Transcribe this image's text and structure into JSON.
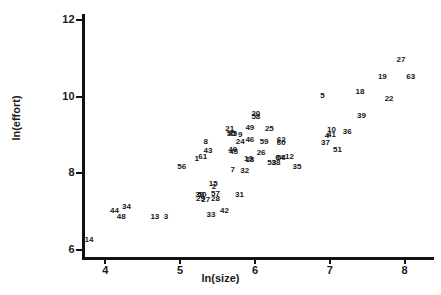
{
  "chart_data": {
    "type": "scatter",
    "title": "",
    "xlabel": "ln(size)",
    "ylabel": "ln(effort)",
    "xlim": [
      3.7,
      8.35
    ],
    "ylim": [
      5.8,
      12.15
    ],
    "xticks": [
      4,
      5,
      6,
      7,
      8
    ],
    "yticks": [
      6,
      8,
      10,
      12
    ],
    "grid": false,
    "legend": null,
    "point_label_field": "case number",
    "points": [
      {
        "label": "14",
        "x": 3.78,
        "y": 6.27
      },
      {
        "label": "44",
        "x": 4.12,
        "y": 7.02
      },
      {
        "label": "34",
        "x": 4.28,
        "y": 7.12
      },
      {
        "label": "48",
        "x": 4.21,
        "y": 6.87
      },
      {
        "label": "13",
        "x": 4.66,
        "y": 6.88
      },
      {
        "label": "3",
        "x": 4.81,
        "y": 6.86
      },
      {
        "label": "56",
        "x": 5.02,
        "y": 8.18
      },
      {
        "label": "1",
        "x": 5.22,
        "y": 8.38
      },
      {
        "label": "61",
        "x": 5.3,
        "y": 8.44
      },
      {
        "label": "43",
        "x": 5.37,
        "y": 8.58
      },
      {
        "label": "8",
        "x": 5.34,
        "y": 8.82
      },
      {
        "label": "33",
        "x": 5.41,
        "y": 6.93
      },
      {
        "label": "42",
        "x": 5.59,
        "y": 7.02
      },
      {
        "label": "30",
        "x": 5.26,
        "y": 7.44
      },
      {
        "label": "50",
        "x": 5.29,
        "y": 7.44
      },
      {
        "label": "29",
        "x": 5.27,
        "y": 7.33
      },
      {
        "label": "27",
        "x": 5.34,
        "y": 7.31
      },
      {
        "label": "28",
        "x": 5.47,
        "y": 7.34
      },
      {
        "label": "57",
        "x": 5.47,
        "y": 7.47
      },
      {
        "label": "15",
        "x": 5.44,
        "y": 7.72
      },
      {
        "label": "2",
        "x": 5.45,
        "y": 7.64
      },
      {
        "label": "31",
        "x": 5.79,
        "y": 7.44
      },
      {
        "label": "7",
        "x": 5.7,
        "y": 8.08
      },
      {
        "label": "32",
        "x": 5.86,
        "y": 8.07
      },
      {
        "label": "40",
        "x": 5.7,
        "y": 8.6
      },
      {
        "label": "45",
        "x": 5.71,
        "y": 8.55
      },
      {
        "label": "21",
        "x": 5.66,
        "y": 9.16
      },
      {
        "label": "55",
        "x": 5.68,
        "y": 9.02
      },
      {
        "label": "45b",
        "x": 5.7,
        "y": 9.02
      },
      {
        "label": "9",
        "x": 5.8,
        "y": 9.0
      },
      {
        "label": "24",
        "x": 5.8,
        "y": 8.83
      },
      {
        "label": "46",
        "x": 5.93,
        "y": 8.88
      },
      {
        "label": "49",
        "x": 5.93,
        "y": 9.18
      },
      {
        "label": "20",
        "x": 6.01,
        "y": 9.56
      },
      {
        "label": "58",
        "x": 6.01,
        "y": 9.46
      },
      {
        "label": "19b",
        "x": 5.91,
        "y": 8.38
      },
      {
        "label": "18b",
        "x": 5.93,
        "y": 8.36
      },
      {
        "label": "26",
        "x": 6.08,
        "y": 8.53
      },
      {
        "label": "59",
        "x": 6.12,
        "y": 8.82
      },
      {
        "label": "25",
        "x": 6.19,
        "y": 9.15
      },
      {
        "label": "53",
        "x": 6.22,
        "y": 8.26
      },
      {
        "label": "38",
        "x": 6.28,
        "y": 8.28
      },
      {
        "label": "64",
        "x": 6.33,
        "y": 8.4
      },
      {
        "label": "54",
        "x": 6.35,
        "y": 8.4
      },
      {
        "label": "62",
        "x": 6.35,
        "y": 8.88
      },
      {
        "label": "60",
        "x": 6.35,
        "y": 8.8
      },
      {
        "label": "12",
        "x": 6.46,
        "y": 8.42
      },
      {
        "label": "35",
        "x": 6.56,
        "y": 8.16
      },
      {
        "label": "5",
        "x": 6.9,
        "y": 10.02
      },
      {
        "label": "37",
        "x": 6.94,
        "y": 8.78
      },
      {
        "label": "4",
        "x": 6.96,
        "y": 8.97
      },
      {
        "label": "41",
        "x": 7.02,
        "y": 9.0
      },
      {
        "label": "10",
        "x": 7.02,
        "y": 9.14
      },
      {
        "label": "51",
        "x": 7.1,
        "y": 8.62
      },
      {
        "label": "36",
        "x": 7.23,
        "y": 9.08
      },
      {
        "label": "39",
        "x": 7.42,
        "y": 9.5
      },
      {
        "label": "18",
        "x": 7.4,
        "y": 10.12
      },
      {
        "label": "19",
        "x": 7.7,
        "y": 10.5
      },
      {
        "label": "22",
        "x": 7.79,
        "y": 9.95
      },
      {
        "label": "27b",
        "x": 7.95,
        "y": 10.95
      },
      {
        "label": "63",
        "x": 8.08,
        "y": 10.5
      }
    ]
  },
  "axes": {
    "y_title": "ln(effort)",
    "x_title": "ln(size)",
    "y_tick_labels": [
      "12",
      "10",
      "8",
      "6"
    ],
    "x_tick_labels": [
      "4",
      "5",
      "6",
      "7",
      "8"
    ]
  },
  "style": {
    "axis_color": "#111111",
    "text_color": "#161616",
    "background": "#ffffff"
  }
}
